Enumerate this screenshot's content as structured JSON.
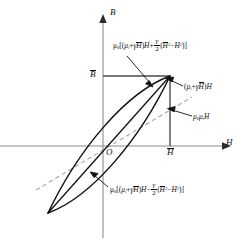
{
  "figure": {
    "type": "hysteresis-loop-diagram",
    "canvas": {
      "width": 246,
      "height": 240,
      "background": "#ffffff"
    },
    "axes": {
      "vertical_label": "B",
      "horizontal_label": "H",
      "origin_label": "O",
      "vertical_tick_label": "B",
      "vertical_tick_has_overbar": true,
      "horizontal_tick_label": "H",
      "horizontal_tick_has_overbar": true,
      "origin_px": {
        "x": 103,
        "y": 146
      },
      "vertical_axis_x_px": 103,
      "horizontal_axis_y_px": 146
    },
    "box": {
      "description": "rectangle from origin to loop tip",
      "left_px": 103,
      "top_px": 76,
      "right_px": 170,
      "bottom_px": 146,
      "stroke": "#444444"
    },
    "loop": {
      "description": "elliptical hysteresis loop through origin-symmetric tips",
      "upper_tip_px": {
        "x": 170,
        "y": 76
      },
      "lower_tip_px": {
        "x": 48,
        "y": 213
      },
      "stroke": "#111111"
    },
    "dashed_line": {
      "description": "straight line of slope mu0*mu_i through the origin",
      "start_px": {
        "x": 36,
        "y": 190
      },
      "end_px": {
        "x": 192,
        "y": 97
      },
      "stroke": "#999999",
      "style": "dashed"
    },
    "colors": {
      "curve": "#111111",
      "box": "#444444",
      "axis": "#888888",
      "dashed": "#999999",
      "text": "#111111"
    }
  },
  "annotations": {
    "upper_branch": {
      "id": "upper-branch-equation",
      "plain_text": "mu0[(mu_i + gamma*Hbar)H + (gamma/2)(Hbar^2 - H^2)]",
      "parts": {
        "prefix_mu": "μ",
        "prefix_sub": "0",
        "open_bracket": "[(",
        "mu_i": "μ",
        "mu_i_sub": "i",
        "plus": "+",
        "gamma": "γ",
        "Hbar": "H",
        "close_paren": ")",
        "H": "H",
        "operator": "+",
        "frac_num": "γ",
        "frac_den": "2",
        "term_open": "(",
        "Hbar2": "H",
        "exp2": "2",
        "minus": "−",
        "H2": "H",
        "exp2b": "2",
        "term_close": ")]"
      },
      "leader_arrow_to_px": {
        "x": 152,
        "y": 86
      }
    },
    "chord_line": {
      "id": "chord-equation",
      "plain_text": "(mu_i + gamma*Hbar)H",
      "parts": {
        "open_paren": "(",
        "mu_i": "μ",
        "mu_i_sub": "i",
        "plus": "+",
        "gamma": "γ",
        "Hbar": "H",
        "close_paren": ")",
        "H": "H"
      },
      "leader_arrow_to_px": {
        "x": 168,
        "y": 79
      }
    },
    "initial_slope": {
      "id": "initial-permeability-equation",
      "plain_text": "mu0*mu_i*H",
      "parts": {
        "mu0": "μ",
        "mu0_sub": "0",
        "mu_i": "μ",
        "mu_i_sub": "i",
        "H": "H"
      },
      "leader_arrow_to_px": {
        "x": 166,
        "y": 113
      }
    },
    "lower_branch": {
      "id": "lower-branch-equation",
      "plain_text": "mu0[(mu_i + gamma*Hbar)H - (gamma/2)(Hbar^2 - H^2)]",
      "parts": {
        "prefix_mu": "μ",
        "prefix_sub": "0",
        "open_bracket": "[(",
        "mu_i": "μ",
        "mu_i_sub": "i",
        "plus": "+",
        "gamma": "γ",
        "Hbar": "H",
        "close_paren": ")",
        "H": "H",
        "operator": "−",
        "frac_num": "γ",
        "frac_den": "2",
        "term_open": "(",
        "Hbar2": "H",
        "exp2": "2",
        "minus": "−",
        "H2": "H",
        "exp2b": "2",
        "term_close": ")]"
      },
      "leader_arrow_to_px": {
        "x": 92,
        "y": 173
      }
    }
  }
}
